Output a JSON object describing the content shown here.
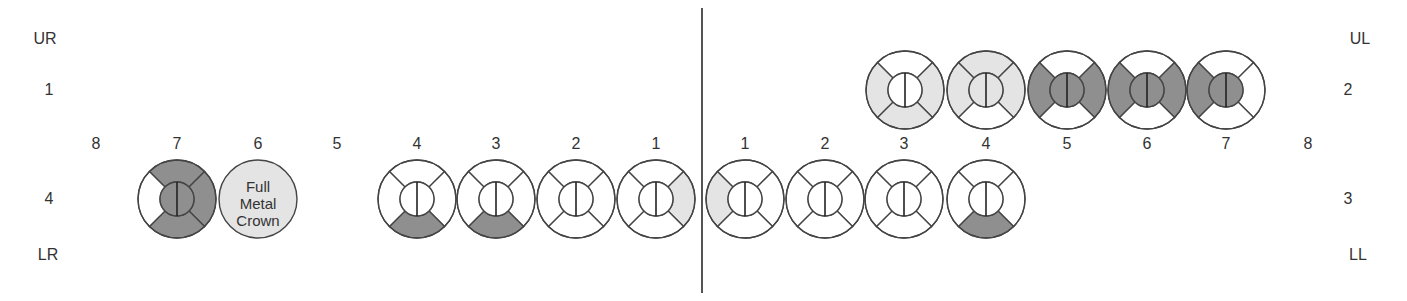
{
  "colors": {
    "white": "#ffffff",
    "light": "#e4e4e4",
    "dark": "#8f8f8f",
    "stroke": "#444444"
  },
  "quadrant_labels": {
    "ur": "UR",
    "ul": "UL",
    "lr": "LR",
    "ll": "LL"
  },
  "side_numbers": {
    "left_upper": "1",
    "left_lower": "4",
    "right_upper": "2",
    "right_lower": "3"
  },
  "tooth_numbers": {
    "right": [
      "8",
      "7",
      "6",
      "5",
      "4",
      "3",
      "2",
      "1"
    ],
    "left": [
      "1",
      "2",
      "3",
      "4",
      "5",
      "6",
      "7",
      "8"
    ]
  },
  "upper_left_teeth": [
    {
      "number": "3",
      "top": "white",
      "left": "light",
      "right": "light",
      "bottom": "light",
      "center": "white"
    },
    {
      "number": "4",
      "top": "light",
      "left": "light",
      "right": "light",
      "bottom": "white",
      "center": "light"
    },
    {
      "number": "5",
      "top": "white",
      "left": "dark",
      "right": "dark",
      "bottom": "white",
      "center": "dark"
    },
    {
      "number": "6",
      "top": "white",
      "left": "dark",
      "right": "dark",
      "bottom": "white",
      "center": "dark"
    },
    {
      "number": "7",
      "top": "white",
      "left": "dark",
      "right": "white",
      "bottom": "white",
      "center": "dark"
    }
  ],
  "lower_right_teeth": [
    {
      "number": "7",
      "top": "dark",
      "left": "white",
      "right": "dark",
      "bottom": "dark",
      "center": "dark"
    },
    {
      "number": "6",
      "crown": true,
      "fill": "light",
      "text": [
        "Full",
        "Metal",
        "Crown"
      ]
    },
    {
      "number": "4",
      "top": "white",
      "left": "white",
      "right": "white",
      "bottom": "dark",
      "center": "white"
    },
    {
      "number": "3",
      "top": "white",
      "left": "white",
      "right": "white",
      "bottom": "dark",
      "center": "white"
    },
    {
      "number": "2",
      "top": "white",
      "left": "white",
      "right": "white",
      "bottom": "white",
      "center": "white"
    },
    {
      "number": "1",
      "top": "white",
      "left": "white",
      "right": "light",
      "bottom": "white",
      "center": "white"
    }
  ],
  "lower_left_teeth": [
    {
      "number": "1",
      "top": "white",
      "left": "light",
      "right": "white",
      "bottom": "white",
      "center": "white"
    },
    {
      "number": "2",
      "top": "white",
      "left": "white",
      "right": "white",
      "bottom": "white",
      "center": "white"
    },
    {
      "number": "3",
      "top": "white",
      "left": "white",
      "right": "white",
      "bottom": "white",
      "center": "white"
    },
    {
      "number": "4",
      "top": "white",
      "left": "white",
      "right": "white",
      "bottom": "dark",
      "center": "white"
    }
  ]
}
